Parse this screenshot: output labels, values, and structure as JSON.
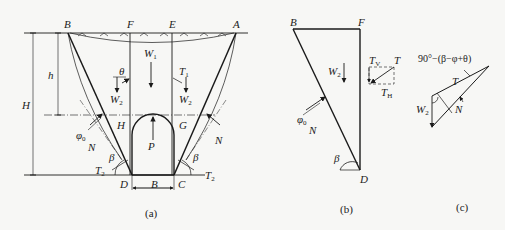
{
  "figure_a": {
    "caption": "(a)",
    "points": {
      "B": "B",
      "F": "F",
      "E": "E",
      "A": "A",
      "H": "H",
      "G": "G",
      "D": "D",
      "C": "C"
    },
    "dims": {
      "H": "H",
      "h": "h",
      "B": "B"
    },
    "forces": {
      "W1": "W",
      "W1_sub": "1",
      "W2_left": "W",
      "W2_left_sub": "2",
      "W2_right": "W",
      "W2_right_sub": "2",
      "theta": "θ",
      "T1": "T",
      "T1_sub": "1",
      "phi0": "φ",
      "phi0_sub": "0",
      "N_left": "N",
      "N_right": "N",
      "P": "P",
      "beta_left": "β",
      "beta_right": "β",
      "T2_left": "T",
      "T2_left_sub": "2",
      "T2_right": "T",
      "T2_right_sub": "2"
    }
  },
  "figure_b": {
    "caption": "(b)",
    "points": {
      "B": "B",
      "F": "F",
      "D": "D"
    },
    "forces": {
      "W2": "W",
      "W2_sub": "2",
      "phi0": "φ",
      "phi0_sub": "0",
      "N": "N",
      "beta": "β",
      "TV": "T",
      "TV_sub": "V",
      "T": "T",
      "TH": "T",
      "TH_sub": "H"
    }
  },
  "figure_c": {
    "caption": "(c)",
    "angle_label": "90°−(β−φ+θ)",
    "forces": {
      "T": "T",
      "W2": "W",
      "W2_sub": "2",
      "N": "N"
    }
  },
  "colors": {
    "line": "#1a1a1a",
    "background": "#f7f7f5"
  }
}
